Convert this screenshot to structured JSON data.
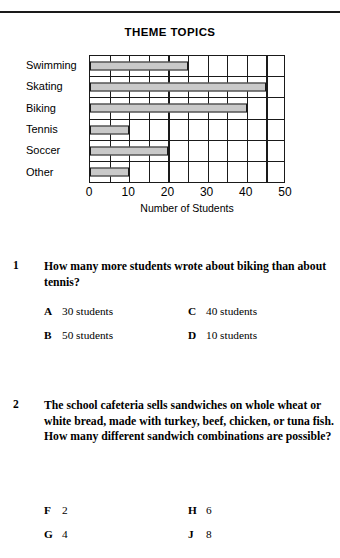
{
  "page": {
    "background": "#ffffff",
    "rule_color": "#1a1a1a"
  },
  "chart_data": {
    "type": "bar",
    "orientation": "horizontal",
    "title": "THEME TOPICS",
    "xlabel": "Number of Students",
    "ylabel": "",
    "categories": [
      "Swimming",
      "Skating",
      "Biking",
      "Tennis",
      "Soccer",
      "Other"
    ],
    "values": [
      25,
      45,
      40,
      10,
      20,
      10
    ],
    "xlim": [
      0,
      50
    ],
    "xticks": [
      0,
      10,
      20,
      30,
      40,
      50
    ],
    "xtick_labels": [
      "0",
      "10",
      "20",
      "30",
      "40",
      "50"
    ],
    "minor_gridline_step": 5,
    "grid": true,
    "legend": null,
    "bar_color": "#c9c9c9",
    "bar_edge_color": "#1a1a1a",
    "axis_color": "#1a1a1a"
  },
  "questions": [
    {
      "number": "1",
      "text": "How many more students wrote about biking than about tennis?",
      "options": [
        {
          "letter": "A",
          "text": "30 students",
          "column": "left"
        },
        {
          "letter": "B",
          "text": "50 students",
          "column": "left"
        },
        {
          "letter": "C",
          "text": "40 students",
          "column": "right"
        },
        {
          "letter": "D",
          "text": "10 students",
          "column": "right"
        }
      ]
    },
    {
      "number": "2",
      "text": "The school cafeteria sells sandwiches on whole wheat or white bread, made with turkey, beef, chicken, or tuna fish. How many different sandwich combinations are possible?",
      "options": [
        {
          "letter": "F",
          "text": "2",
          "column": "left"
        },
        {
          "letter": "G",
          "text": "4",
          "column": "left"
        },
        {
          "letter": "H",
          "text": "6",
          "column": "right"
        },
        {
          "letter": "J",
          "text": "8",
          "column": "right"
        }
      ]
    }
  ]
}
